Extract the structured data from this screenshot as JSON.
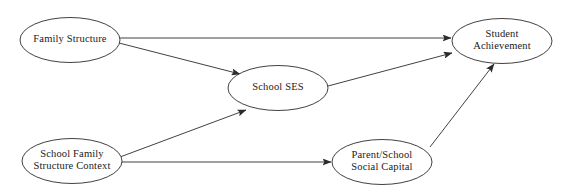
{
  "diagram": {
    "type": "path-diagram",
    "background_color": "#ffffff",
    "line_color": "#2b2b2b",
    "text_color": "#1a1a1a",
    "nodes": [
      {
        "id": "family-structure",
        "lines": [
          "Family Structure"
        ],
        "cx": 70,
        "cy": 40,
        "rx": 50,
        "ry": 22.5
      },
      {
        "id": "school-ses",
        "lines": [
          "School SES"
        ],
        "cx": 278,
        "cy": 88,
        "rx": 50,
        "ry": 22.5
      },
      {
        "id": "student-achievement",
        "lines": [
          "Student",
          "Achievement"
        ],
        "cx": 502,
        "cy": 41,
        "rx": 50,
        "ry": 22.5
      },
      {
        "id": "school-family-structure-context",
        "lines": [
          "School Family",
          "Structure Context"
        ],
        "cx": 72,
        "cy": 161,
        "rx": 50,
        "ry": 22.5
      },
      {
        "id": "parent-school-social-capital",
        "lines": [
          "Parent/School",
          "Social Capital"
        ],
        "cx": 382,
        "cy": 162,
        "rx": 50,
        "ry": 22.5
      }
    ],
    "edges": [
      {
        "id": "family-structure-to-student-achievement",
        "from": "family-structure",
        "to": "student-achievement",
        "x1": 120,
        "y1": 38,
        "x2": 451,
        "y2": 38
      },
      {
        "id": "family-structure-to-school-ses",
        "from": "family-structure",
        "to": "school-ses",
        "x1": 119,
        "y1": 43,
        "x2": 240,
        "y2": 74
      },
      {
        "id": "school-ses-to-student-achievement",
        "from": "school-ses",
        "to": "student-achievement",
        "x1": 328,
        "y1": 86,
        "x2": 452,
        "y2": 53
      },
      {
        "id": "school-family-structure-context-to-school-ses",
        "from": "school-family-structure-context",
        "to": "school-ses",
        "x1": 120,
        "y1": 157,
        "x2": 246,
        "y2": 110
      },
      {
        "id": "school-family-structure-context-to-parent-school-social-capital",
        "from": "school-family-structure-context",
        "to": "parent-school-social-capital",
        "x1": 120,
        "y1": 162,
        "x2": 331,
        "y2": 162
      },
      {
        "id": "parent-school-social-capital-to-student-achievement",
        "from": "parent-school-social-capital",
        "to": "student-achievement",
        "x1": 430,
        "y1": 147,
        "x2": 494,
        "y2": 64
      }
    ]
  }
}
